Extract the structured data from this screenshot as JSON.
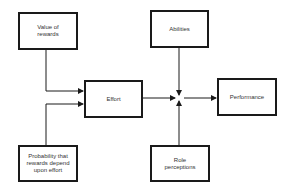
{
  "diagram": {
    "nodes": [
      {
        "id": "value_of_rewards",
        "label": "Value of rewards"
      },
      {
        "id": "effort",
        "label": "Effort"
      },
      {
        "id": "abilities",
        "label": "Abilities"
      },
      {
        "id": "performance",
        "label": "Performance"
      },
      {
        "id": "probability",
        "label": "Probability that rewards depend upon effort"
      },
      {
        "id": "role_perceptions",
        "label": "Role perceptions"
      }
    ],
    "edges": [
      {
        "from": "value_of_rewards",
        "to": "effort"
      },
      {
        "from": "probability",
        "to": "effort"
      },
      {
        "from": "effort",
        "to": "junction"
      },
      {
        "from": "abilities",
        "to": "junction"
      },
      {
        "from": "role_perceptions",
        "to": "junction"
      },
      {
        "from": "junction",
        "to": "performance"
      }
    ],
    "line_color": "#1a1a1a"
  }
}
